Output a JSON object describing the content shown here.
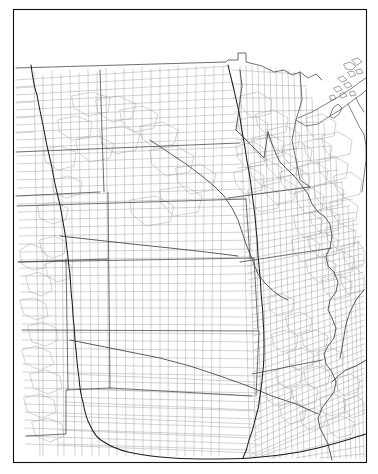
{
  "figure": {
    "title": "",
    "kind": "county-outline-map",
    "background_color": "#ffffff",
    "frame_color": "#111111",
    "county_line_color": "#9a9a9a",
    "state_line_color": "#4a4a4a",
    "contour_line_color": "#1c1c1c",
    "water_line_color": "#404040"
  },
  "frame": {
    "x": 13,
    "y": 9,
    "width": 353,
    "height": 453,
    "label": "map-border"
  },
  "chart_data": {
    "type": "map",
    "projection": "conic",
    "title": "",
    "xlabel": "",
    "ylabel": "",
    "grid": false,
    "legend": "none",
    "region": "United States Midwest and Great Plains",
    "layers": [
      {
        "name": "county-boundaries",
        "color": "#9a9a9a",
        "width": 0.45
      },
      {
        "name": "state-boundaries",
        "color": "#4a4a4a",
        "width": 0.8
      },
      {
        "name": "coastline-great-lakes",
        "color": "#555555",
        "width": 0.75
      },
      {
        "name": "rivers",
        "color": "#404040",
        "width": 0.85
      },
      {
        "name": "contour-isolines",
        "color": "#1c1c1c",
        "width": 1.05
      }
    ],
    "annotations": [
      {
        "feature": "Lake Superior",
        "approx_xy": [
          318,
          92
        ]
      },
      {
        "feature": "Isle Royale",
        "approx_xy": [
          352,
          68
        ]
      },
      {
        "feature": "Mississippi River",
        "approx_xy": [
          300,
          300
        ]
      },
      {
        "feature": "Northwest Angle",
        "approx_xy": [
          241,
          63
        ]
      },
      {
        "feature": "Western isoline",
        "approx_xy": [
          60,
          250
        ]
      },
      {
        "feature": "Central isoline",
        "approx_xy": [
          252,
          250
        ]
      }
    ],
    "contours": [
      {
        "id": "western-isoline",
        "note": "runs from northern border south then curves southeast to the bottom edge",
        "points": [
          [
            31,
            65
          ],
          [
            37,
            95
          ],
          [
            44,
            130
          ],
          [
            52,
            168
          ],
          [
            60,
            205
          ],
          [
            66,
            240
          ],
          [
            70,
            275
          ],
          [
            72,
            300
          ],
          [
            74,
            325
          ],
          [
            76,
            350
          ],
          [
            79,
            378
          ],
          [
            83,
            402
          ],
          [
            90,
            425
          ],
          [
            104,
            442
          ],
          [
            128,
            452
          ],
          [
            160,
            457
          ],
          [
            200,
            459
          ],
          [
            250,
            458
          ],
          [
            300,
            452
          ],
          [
            340,
            442
          ],
          [
            366,
            434
          ]
        ]
      },
      {
        "id": "central-isoline",
        "note": "runs from northern border south through the Plains to the bottom edge",
        "points": [
          [
            228,
            65
          ],
          [
            234,
            90
          ],
          [
            240,
            118
          ],
          [
            245,
            148
          ],
          [
            250,
            178
          ],
          [
            254,
            208
          ],
          [
            257,
            238
          ],
          [
            259,
            265
          ],
          [
            261,
            292
          ],
          [
            263,
            318
          ],
          [
            264,
            344
          ],
          [
            263,
            370
          ],
          [
            260,
            396
          ],
          [
            255,
            420
          ],
          [
            249,
            440
          ],
          [
            243,
            458
          ]
        ]
      }
    ]
  },
  "accessibility": {
    "description": "Black and white outline map of United States counties covering the Great Plains, upper Midwest and Mississippi valley, with two darker curved isolines and the Great Lakes shoreline."
  }
}
